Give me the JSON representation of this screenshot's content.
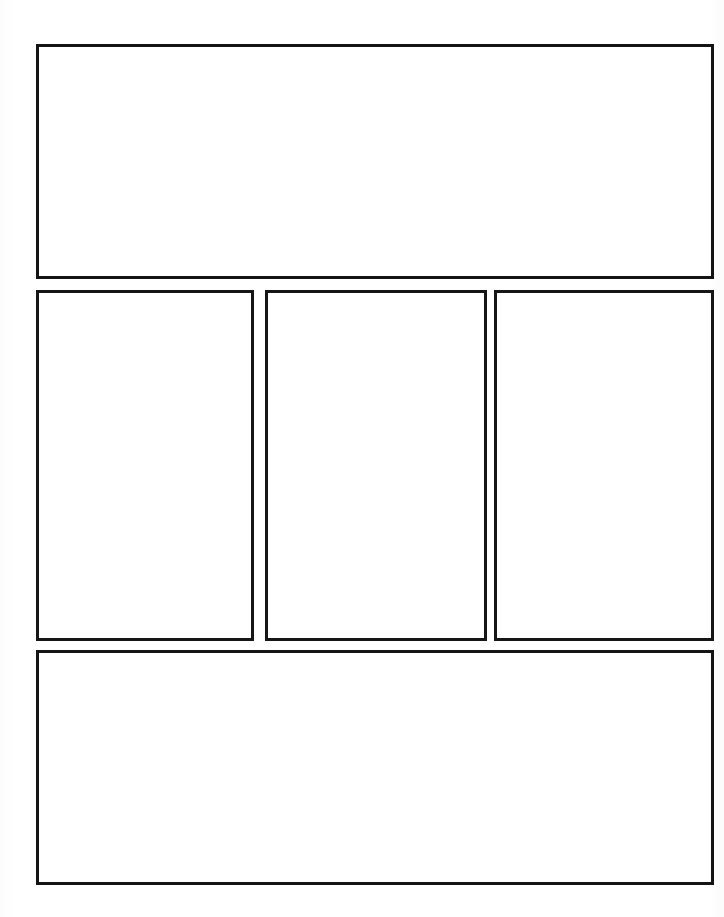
{
  "page": {
    "background_color": "#ffffff",
    "border_color": "#141414",
    "width": 724,
    "height": 917
  },
  "layout": {
    "type": "comic-page-template",
    "row_count": 3,
    "panel_count": 5
  },
  "panels": [
    {
      "id": "panel-top",
      "row": 1,
      "position": "full-width-top",
      "orientation": "landscape",
      "content": "",
      "x": 36,
      "y": 44,
      "width": 678,
      "height": 235
    },
    {
      "id": "panel-mid-left",
      "row": 2,
      "position": "middle-left",
      "orientation": "portrait",
      "content": "",
      "x": 36,
      "y": 290,
      "width": 218,
      "height": 351
    },
    {
      "id": "panel-mid-center",
      "row": 2,
      "position": "middle-center",
      "orientation": "portrait",
      "content": "",
      "x": 265,
      "y": 290,
      "width": 222,
      "height": 351
    },
    {
      "id": "panel-mid-right",
      "row": 2,
      "position": "middle-right",
      "orientation": "portrait",
      "content": "",
      "x": 494,
      "y": 290,
      "width": 220,
      "height": 351
    },
    {
      "id": "panel-bottom",
      "row": 3,
      "position": "full-width-bottom",
      "orientation": "landscape",
      "content": "",
      "x": 36,
      "y": 650,
      "width": 678,
      "height": 235
    }
  ]
}
